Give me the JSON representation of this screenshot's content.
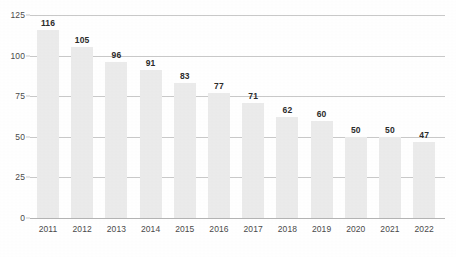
{
  "chart_data": {
    "type": "bar",
    "title": "",
    "subtitle": "",
    "xlabel": "",
    "ylabel": "",
    "categories": [
      "2011",
      "2012",
      "2013",
      "2014",
      "2015",
      "2016",
      "2017",
      "2018",
      "2019",
      "2020",
      "2021",
      "2022"
    ],
    "values": [
      116,
      105,
      96,
      91,
      83,
      77,
      71,
      62,
      60,
      50,
      50,
      47
    ],
    "data_labels": [
      "116",
      "105",
      "96",
      "91",
      "83",
      "77",
      "71",
      "62",
      "60",
      "50",
      "50",
      "47"
    ],
    "ylim": [
      0,
      125
    ],
    "ytick_values": [
      0,
      25,
      50,
      75,
      100,
      125
    ],
    "ytick_labels": [
      "0",
      "25",
      "50",
      "75",
      "100",
      "125"
    ],
    "grid": true,
    "grid_axis": "y",
    "legend": false,
    "legend_position": "none",
    "annotations": [],
    "series": [
      {
        "name": "",
        "values": [
          116,
          105,
          96,
          91,
          83,
          77,
          71,
          62,
          60,
          50,
          50,
          47
        ]
      }
    ]
  },
  "style": {
    "background_color": "#ffffff",
    "bar_color": "#ebebeb",
    "gridline_color": "#c9c9c9",
    "baseline_color": "#b4b4b4",
    "tick_label_color": "#4a4a4a",
    "data_label_color": "#2b2b2b"
  }
}
